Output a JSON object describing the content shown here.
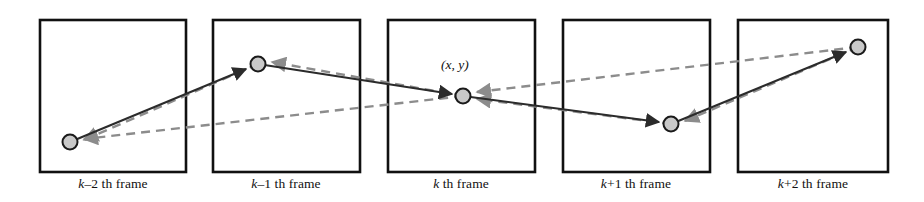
{
  "figure": {
    "type": "diagram",
    "background_color": "#ffffff",
    "width": 924,
    "height": 202,
    "colors": {
      "frame_border": "#111111",
      "solid_trajectory": "#2b2b2b",
      "dashed_trajectory": "#8c8c8c",
      "node_fill": "#c9c9c9",
      "node_stroke": "#1a1a1a",
      "text": "#111111"
    },
    "frames": [
      {
        "id": "frame-k-minus-2",
        "caption_var": "k",
        "caption_offset": "–2",
        "caption_suffix": " th frame",
        "caption_full": "k–2 th frame",
        "rect": {
          "x": 40,
          "y": 20,
          "w": 146,
          "h": 152
        },
        "caption_center_x": 113,
        "node": {
          "cx": 70,
          "cy": 142,
          "r": 7.5
        }
      },
      {
        "id": "frame-k-minus-1",
        "caption_var": "k",
        "caption_offset": "–1",
        "caption_suffix": " th frame",
        "caption_full": "k–1 th frame",
        "rect": {
          "x": 213,
          "y": 20,
          "w": 147,
          "h": 152
        },
        "caption_center_x": 286,
        "node": {
          "cx": 258,
          "cy": 64,
          "r": 7.5
        }
      },
      {
        "id": "frame-k",
        "caption_var": "k",
        "caption_offset": "",
        "caption_suffix": " th frame",
        "caption_full": "k th frame",
        "rect": {
          "x": 388,
          "y": 20,
          "w": 147,
          "h": 152
        },
        "caption_center_x": 461,
        "node": {
          "cx": 463,
          "cy": 96,
          "r": 7.5
        },
        "point_label": "(x, y)",
        "point_label_x": 441,
        "point_label_y": 57
      },
      {
        "id": "frame-k-plus-1",
        "caption_var": "k",
        "caption_offset": "+1",
        "caption_suffix": " th frame",
        "caption_full": "k+1 th frame",
        "rect": {
          "x": 563,
          "y": 20,
          "w": 147,
          "h": 152
        },
        "caption_center_x": 636,
        "node": {
          "cx": 671,
          "cy": 124,
          "r": 7.5
        }
      },
      {
        "id": "frame-k-plus-2",
        "caption_var": "k",
        "caption_offset": "+2",
        "caption_suffix": " th frame",
        "caption_full": "k+2 th frame",
        "rect": {
          "x": 738,
          "y": 20,
          "w": 150,
          "h": 152
        },
        "caption_center_x": 813,
        "node": {
          "cx": 858,
          "cy": 47,
          "r": 7.5
        }
      }
    ],
    "trajectories": {
      "forward_solid": {
        "style": "solid",
        "color": "#2b2b2b",
        "arrow_direction": "forward-and-backward",
        "points": [
          {
            "x": 70,
            "y": 142
          },
          {
            "x": 258,
            "y": 64
          },
          {
            "x": 463,
            "y": 96
          },
          {
            "x": 671,
            "y": 124
          },
          {
            "x": 858,
            "y": 47
          }
        ]
      },
      "backward_dashed": {
        "style": "dashed",
        "color": "#8c8c8c",
        "arrow_direction": "backward",
        "points": [
          {
            "x": 858,
            "y": 47
          },
          {
            "x": 671,
            "y": 124
          },
          {
            "x": 463,
            "y": 96
          },
          {
            "x": 258,
            "y": 64
          },
          {
            "x": 70,
            "y": 142
          }
        ],
        "long_chords": [
          {
            "from": {
              "x": 463,
              "y": 96
            },
            "to": {
              "x": 70,
              "y": 142
            }
          },
          {
            "from": {
              "x": 858,
              "y": 47
            },
            "to": {
              "x": 463,
              "y": 96
            }
          }
        ]
      }
    }
  }
}
